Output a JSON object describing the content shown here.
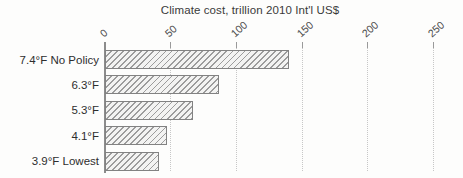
{
  "chart_data": {
    "type": "bar",
    "orientation": "horizontal",
    "title": "Climate cost, trillion 2010 Int'l US$",
    "categories": [
      "7.4°F No Policy",
      "6.3°F",
      "5.3°F",
      "4.1°F",
      "3.9°F Lowest"
    ],
    "values": [
      140,
      87,
      67,
      47,
      41
    ],
    "xlabel": "",
    "ylabel": "",
    "xlim": [
      0,
      250
    ],
    "xticks": [
      0,
      50,
      100,
      150,
      200,
      250
    ],
    "tick_label_rotation_deg": 45,
    "grid": "vertical-dotted",
    "bar_style": "diagonal-hatch",
    "legend": "none"
  },
  "colors": {
    "background": "#fdfdfc",
    "axis": "#8c8c8c",
    "gridline": "#c7c7c7",
    "bar_border": "#828282",
    "bar_hatch": "#9c9c9c",
    "bar_fill": "#f3f3f2",
    "text": "#3a3a3a"
  }
}
